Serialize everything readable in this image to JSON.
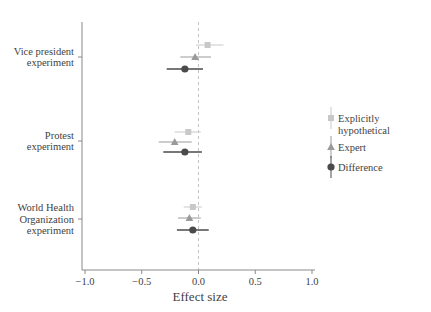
{
  "chart_data": {
    "type": "scatter",
    "title": "",
    "subtitle": "",
    "xlabel": "Effect size",
    "ylabel": "",
    "xlim": [
      -1.25,
      1.25
    ],
    "xticks": [
      -1.0,
      -0.5,
      0.0,
      0.5,
      1.0
    ],
    "xticklabels": [
      "−1.0",
      "−0.5",
      "0.0",
      "0.5",
      "1.0"
    ],
    "grid": false,
    "reference_line": {
      "x": 0.0,
      "style": "dashed",
      "color": "#bdbdbd"
    },
    "legend_position": "right",
    "categories": [
      "Vice president experiment",
      "Protest experiment",
      "World Health Organization experiment"
    ],
    "category_labels": [
      [
        "Vice president",
        "experiment"
      ],
      [
        "Protest",
        "experiment"
      ],
      [
        "World Health",
        "Organization",
        "experiment"
      ]
    ],
    "series": [
      {
        "name": "Explicitly hypothetical",
        "marker": "square",
        "color": "#c8c8c8",
        "values": [
          0.08,
          -0.09,
          -0.05
        ],
        "ci_low": [
          -0.02,
          -0.21,
          -0.13
        ],
        "ci_high": [
          0.22,
          0.02,
          0.03
        ]
      },
      {
        "name": "Expert",
        "marker": "triangle",
        "color": "#9a9a9a",
        "values": [
          -0.03,
          -0.21,
          -0.08
        ],
        "ci_low": [
          -0.16,
          -0.35,
          -0.18
        ],
        "ci_high": [
          0.11,
          -0.06,
          0.02
        ]
      },
      {
        "name": "Difference",
        "marker": "circle",
        "color": "#4a4a4a",
        "values": [
          -0.12,
          -0.12,
          -0.05
        ],
        "ci_low": [
          -0.28,
          -0.31,
          -0.19
        ],
        "ci_high": [
          0.04,
          0.03,
          0.09
        ]
      }
    ]
  },
  "axis": {
    "x_title": "Effect size",
    "tick_labels": [
      "−1.0",
      "−0.5",
      "0.0",
      "0.5",
      "1.0"
    ]
  },
  "y_categories": [
    {
      "lines": [
        "Vice president",
        "experiment"
      ]
    },
    {
      "lines": [
        "Protest",
        "experiment"
      ]
    },
    {
      "lines": [
        "World Health",
        "Organization",
        "experiment"
      ]
    }
  ],
  "legend": {
    "items": [
      {
        "label_lines": [
          "Explicitly",
          "hypothetical"
        ],
        "marker": "square",
        "color": "#c8c8c8"
      },
      {
        "label_lines": [
          "Expert"
        ],
        "marker": "triangle",
        "color": "#9a9a9a"
      },
      {
        "label_lines": [
          "Difference"
        ],
        "marker": "circle",
        "color": "#4a4a4a"
      }
    ]
  },
  "colors": {
    "axis": "#8a8a8a",
    "text": "#3f3f3f",
    "reference": "#c4c4c4",
    "explicitly_hypothetical": "#c8c8c8",
    "expert": "#9a9a9a",
    "difference": "#4a4a4a"
  }
}
